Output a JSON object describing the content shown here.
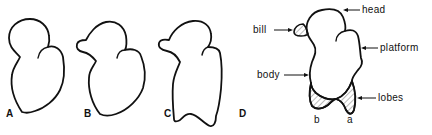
{
  "figure": {
    "panels": [
      {
        "id": "A",
        "label": "A"
      },
      {
        "id": "B",
        "label": "B"
      },
      {
        "id": "C",
        "label": "C"
      },
      {
        "id": "D",
        "label": "D"
      }
    ],
    "annotated_shape": {
      "parts": {
        "head": "head",
        "bill": "bill",
        "platform": "platform",
        "body": "body",
        "lobes": "lobes"
      },
      "lobe_labels": {
        "a": "a",
        "b": "b"
      }
    },
    "colors": {
      "stroke": "#111111",
      "background": "#ffffff"
    }
  }
}
